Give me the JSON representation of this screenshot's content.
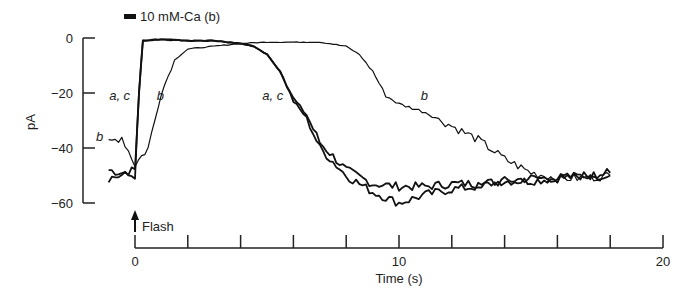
{
  "chart_data": {
    "type": "line",
    "title": "",
    "xlabel": "Time (s)",
    "ylabel": "pA",
    "xlim": [
      0,
      20
    ],
    "ylim": [
      -60,
      0
    ],
    "x_ticks": [
      0,
      2,
      4,
      6,
      8,
      10,
      12,
      14,
      16,
      18,
      20
    ],
    "x_tick_labels": [
      "0",
      "10",
      "20"
    ],
    "y_ticks": [
      0,
      -20,
      -40,
      -60
    ],
    "y_tick_labels": [
      "0",
      "−20",
      "−40",
      "−60"
    ],
    "grid": false,
    "annotations": {
      "bar_label": "10 mM-Ca (b)",
      "flash_label": "Flash",
      "flash_time": 0
    },
    "series": [
      {
        "name": "a",
        "x": [
          -1,
          -0.5,
          0,
          0.15,
          0.3,
          1,
          2,
          3,
          4,
          4.5,
          5,
          5.5,
          6,
          6.5,
          7,
          8,
          9,
          10,
          11,
          12,
          13,
          14,
          15,
          16,
          17,
          18
        ],
        "y": [
          -48,
          -49,
          -48,
          -20,
          -1,
          -0.5,
          -1,
          -1,
          -2,
          -3,
          -6,
          -12,
          -22,
          -28,
          -38,
          -48,
          -53,
          -54,
          -54,
          -53,
          -53,
          -52,
          -52,
          -51,
          -50,
          -50
        ]
      },
      {
        "name": "c",
        "x": [
          -1,
          -0.5,
          0,
          0.15,
          0.3,
          1,
          2,
          3,
          4,
          4.5,
          5,
          5.5,
          6,
          6.5,
          7,
          8,
          9,
          10,
          11,
          12,
          13,
          14,
          15,
          16,
          17,
          18
        ],
        "y": [
          -51,
          -50,
          -50,
          -20,
          -1,
          -0.5,
          -1,
          -1,
          -2,
          -3,
          -6,
          -12,
          -23,
          -29,
          -40,
          -50,
          -56,
          -60,
          -57,
          -55,
          -54,
          -52,
          -51,
          -51,
          -50,
          -49
        ]
      },
      {
        "name": "b",
        "x": [
          -1,
          -0.5,
          0,
          0.5,
          1,
          1.5,
          2,
          3,
          4,
          5,
          6,
          7,
          8,
          8.5,
          9,
          9.5,
          10,
          11,
          12,
          13,
          14,
          15,
          16,
          17,
          18
        ],
        "y": [
          -38,
          -36,
          -46,
          -40,
          -20,
          -8,
          -4,
          -3,
          -2,
          -1.5,
          -1.5,
          -1.5,
          -3,
          -6,
          -12,
          -21,
          -24,
          -27,
          -32,
          -37,
          -44,
          -49,
          -51,
          -51,
          -50
        ]
      }
    ],
    "curve_labels": [
      {
        "text": "a, c",
        "x": -0.6,
        "y": -21
      },
      {
        "text": "b",
        "x": 1.2,
        "y": -21
      },
      {
        "text": "b",
        "x": -1.1,
        "y": -36
      },
      {
        "text": "a, c",
        "x": 5.2,
        "y": -21
      },
      {
        "text": "b",
        "x": 11.2,
        "y": -21
      }
    ]
  }
}
